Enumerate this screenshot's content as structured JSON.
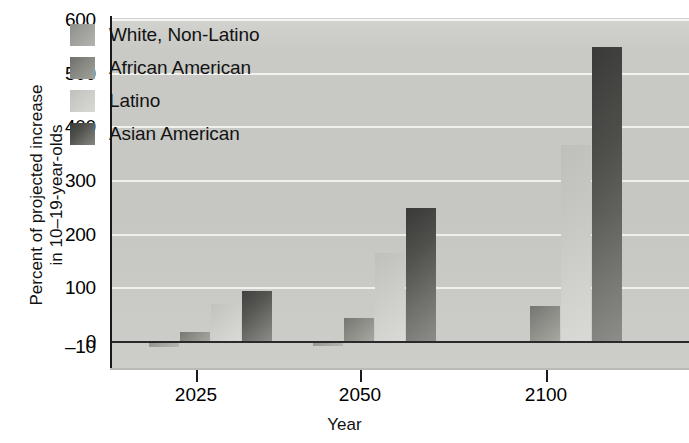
{
  "chart_data": {
    "type": "bar",
    "title": "",
    "xlabel": "Year",
    "ylabel": "Percent of projected increase in 10–19-year-olds",
    "ylabel_line1": "Percent of projected increase",
    "ylabel_line2": "in 10–19-year-olds",
    "categories": [
      "2025",
      "2050",
      "2100"
    ],
    "ylim": [
      -10,
      600
    ],
    "yticks": [
      600,
      500,
      400,
      300,
      200,
      100,
      0,
      -10
    ],
    "ytick_labels": [
      "600",
      "500",
      "400",
      "300",
      "200",
      "100",
      "0",
      "–10"
    ],
    "grid": true,
    "grid_axis": "y",
    "legend_position": "upper-left-inside",
    "series": [
      {
        "name": "White, Non-Latino",
        "color": "#9c9c98",
        "values": [
          -10,
          -8,
          0
        ]
      },
      {
        "name": "African American",
        "color": "#85857f",
        "values": [
          18,
          45,
          68
        ]
      },
      {
        "name": "Latino",
        "color": "#cacac6",
        "values": [
          70,
          165,
          368
        ]
      },
      {
        "name": "Asian American",
        "color": "#4e4e4b",
        "values": [
          95,
          250,
          550
        ]
      }
    ]
  },
  "legend": {
    "items": [
      {
        "label": "White, Non-Latino"
      },
      {
        "label": "African American"
      },
      {
        "label": "Latino"
      },
      {
        "label": "Asian American"
      }
    ]
  },
  "axes": {
    "y_title_line1": "Percent of projected increase",
    "y_title_line2": "in 10–19-year-olds",
    "x_title": "Year",
    "y_tick_labels": [
      "600",
      "500",
      "400",
      "300",
      "200",
      "100",
      "0",
      "–10"
    ],
    "x_tick_labels": [
      "2025",
      "2050",
      "2100"
    ]
  },
  "colors": {
    "plot_background": "#c9c9c5",
    "gridline": "#f2f2ee",
    "axis": "#1a1a1a",
    "text": "#111111"
  }
}
